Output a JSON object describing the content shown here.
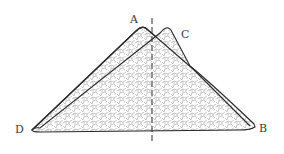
{
  "figure": {
    "type": "folded-shape-diagram",
    "labels": {
      "a": "A",
      "b": "B",
      "c": "C",
      "d": "D"
    },
    "points": {
      "A": [
        143,
        27
      ],
      "C": [
        168,
        27
      ],
      "D": [
        32,
        130
      ],
      "B": [
        255,
        127
      ]
    },
    "axis": {
      "style": "dashed vertical center line",
      "x": 152,
      "y_start": 18,
      "y_end": 142
    },
    "colors": {
      "outline": "#2a2a2a",
      "texture": "#9a9a9a",
      "background": "#ffffff"
    }
  }
}
